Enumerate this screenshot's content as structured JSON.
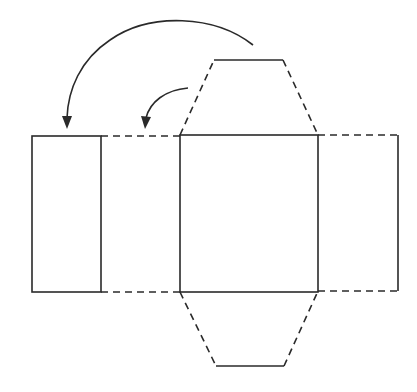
{
  "diagram": {
    "colors": {
      "line": "#2a2a2a",
      "background": "#ffffff"
    },
    "panels": [
      {
        "id": "left-end-panel",
        "style": "solid"
      },
      {
        "id": "left-side-panel",
        "style": "dashed-top-bottom"
      },
      {
        "id": "center-square",
        "style": "solid"
      },
      {
        "id": "right-side-panel",
        "style": "dashed-top-bottom"
      },
      {
        "id": "top-trapezoid-flap",
        "style": "dashed-sides"
      },
      {
        "id": "bottom-trapezoid-flap",
        "style": "dashed-sides"
      }
    ],
    "arrows": [
      {
        "id": "large-fold-arrow",
        "from": "top-flap",
        "to": "left-end-panel"
      },
      {
        "id": "small-fold-arrow",
        "from": "top-flap",
        "to": "left-side-panel"
      }
    ]
  }
}
